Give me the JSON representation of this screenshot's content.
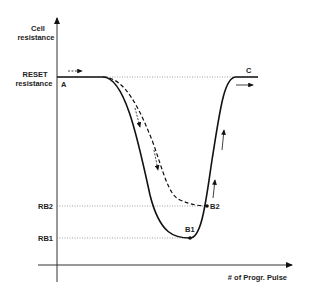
{
  "diagram": {
    "y_axis_label_line1": "Cell",
    "y_axis_label_line2": "resistance",
    "x_axis_label": "# of Progr. Pulse",
    "reset_label_line1": "RESET",
    "reset_label_line2": "resistance",
    "rb2_label": "RB2",
    "rb1_label": "RB1",
    "point_a": "A",
    "point_b1": "B1",
    "point_b2": "B2",
    "point_c": "C",
    "colors": {
      "line": "#111111",
      "dotted": "#777777",
      "background": "#ffffff"
    }
  }
}
